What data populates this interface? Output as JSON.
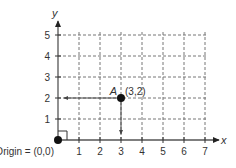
{
  "diagram": {
    "title": "",
    "axes": {
      "x_label": "x",
      "y_label": "y",
      "x_ticks": [
        "1",
        "2",
        "3",
        "4",
        "5",
        "6",
        "7"
      ],
      "y_ticks": [
        "1",
        "2",
        "3",
        "4",
        "5"
      ],
      "x_range": [
        0,
        7
      ],
      "y_range": [
        0,
        5
      ],
      "grid": "dashed"
    },
    "origin": {
      "label": "Origin = (0,0)",
      "x": 0,
      "y": 0
    },
    "point": {
      "name": "A",
      "coords_label": "(3,2)",
      "x": 3,
      "y": 2
    },
    "colors": {
      "axis": "#555555",
      "grid": "#777777",
      "point": "#111111",
      "text": "#333333"
    }
  }
}
